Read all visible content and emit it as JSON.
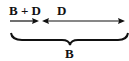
{
  "diagram": {
    "labels": {
      "left_segment": "B + D",
      "right_segment": "D",
      "brace": "B"
    },
    "colors": {
      "ink": "#111111",
      "background": "#ffffff"
    }
  }
}
